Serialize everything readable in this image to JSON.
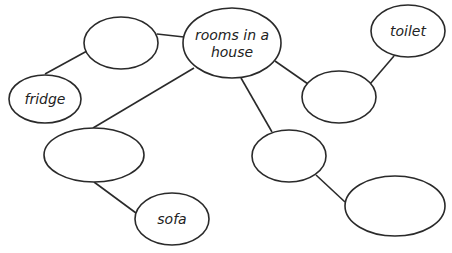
{
  "diagram": {
    "type": "mind-map",
    "nodes": [
      {
        "id": "center",
        "label_lines": [
          "rooms in a",
          "house"
        ],
        "cx": 232,
        "cy": 43,
        "rx": 49,
        "ry": 35
      },
      {
        "id": "a",
        "label_lines": [],
        "cx": 121,
        "cy": 43,
        "rx": 37,
        "ry": 26
      },
      {
        "id": "fridge",
        "label_lines": [
          "fridge"
        ],
        "cx": 45,
        "cy": 99,
        "rx": 36,
        "ry": 24
      },
      {
        "id": "toilet",
        "label_lines": [
          "toilet"
        ],
        "cx": 408,
        "cy": 31,
        "rx": 37,
        "ry": 26
      },
      {
        "id": "b",
        "label_lines": [],
        "cx": 339,
        "cy": 97,
        "rx": 37,
        "ry": 26
      },
      {
        "id": "c",
        "label_lines": [],
        "cx": 94,
        "cy": 155,
        "rx": 50,
        "ry": 27
      },
      {
        "id": "sofa",
        "label_lines": [
          "sofa"
        ],
        "cx": 172,
        "cy": 219,
        "rx": 37,
        "ry": 26
      },
      {
        "id": "d",
        "label_lines": [],
        "cx": 289,
        "cy": 156,
        "rx": 37,
        "ry": 26
      },
      {
        "id": "e",
        "label_lines": [],
        "cx": 395,
        "cy": 206,
        "rx": 50,
        "ry": 30
      }
    ],
    "edges": [
      {
        "from": "a",
        "to": "center",
        "x1": 157,
        "y1": 34,
        "x2": 184,
        "y2": 37
      },
      {
        "from": "a",
        "to": "fridge",
        "x1": 87,
        "y1": 51,
        "x2": 45,
        "y2": 74
      },
      {
        "from": "center",
        "to": "c",
        "x1": 194,
        "y1": 68,
        "x2": 93,
        "y2": 128
      },
      {
        "from": "center",
        "to": "b",
        "x1": 275,
        "y1": 61,
        "x2": 308,
        "y2": 84
      },
      {
        "from": "center",
        "to": "d",
        "x1": 241,
        "y1": 78,
        "x2": 272,
        "y2": 132
      },
      {
        "from": "toilet",
        "to": "b",
        "x1": 394,
        "y1": 56,
        "x2": 370,
        "y2": 84
      },
      {
        "from": "c",
        "to": "sofa",
        "x1": 94,
        "y1": 182,
        "x2": 136,
        "y2": 213
      },
      {
        "from": "d",
        "to": "e",
        "x1": 316,
        "y1": 175,
        "x2": 345,
        "y2": 202
      }
    ]
  }
}
